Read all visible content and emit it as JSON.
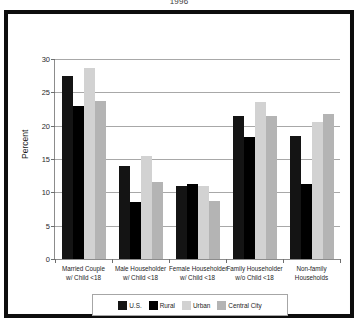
{
  "chart_data": {
    "type": "bar",
    "title": "1996",
    "xlabel": "",
    "ylabel": "Percent",
    "ylim": [
      0,
      30
    ],
    "yticks": [
      0,
      5,
      10,
      15,
      20,
      25,
      30
    ],
    "grid": true,
    "legend_position": "bottom",
    "categories": [
      "Married Couple\nw/ Child <18",
      "Male Householder\nw/ Child <18",
      "Female Householder\nw/ Child <18",
      "Family Householder\nw/o Child <18",
      "Non-family\nHouseholds"
    ],
    "category_lines": [
      [
        "Married Couple",
        "w/ Child <18"
      ],
      [
        "Male Householder",
        "w/ Child <18"
      ],
      [
        "Female Householder",
        "w/ Child <18"
      ],
      [
        "Family Householder",
        "w/o Child <18"
      ],
      [
        "Non-family",
        "Households"
      ]
    ],
    "series": [
      {
        "name": "U.S.",
        "color": "#141414",
        "values": [
          27.5,
          13.9,
          10.9,
          21.5,
          18.4
        ]
      },
      {
        "name": "Rural",
        "color": "#000000",
        "values": [
          23.0,
          8.5,
          11.3,
          18.3,
          11.3
        ]
      },
      {
        "name": "Urban",
        "color": "#d2d2d2",
        "values": [
          28.7,
          15.5,
          10.9,
          23.5,
          20.5
        ]
      },
      {
        "name": "Central City",
        "color": "#b4b4b4",
        "values": [
          23.7,
          11.5,
          8.7,
          21.5,
          21.8
        ]
      }
    ]
  },
  "legend": {
    "items": [
      {
        "label": "U.S."
      },
      {
        "label": "Rural"
      },
      {
        "label": "Urban"
      },
      {
        "label": "Central City"
      }
    ]
  }
}
